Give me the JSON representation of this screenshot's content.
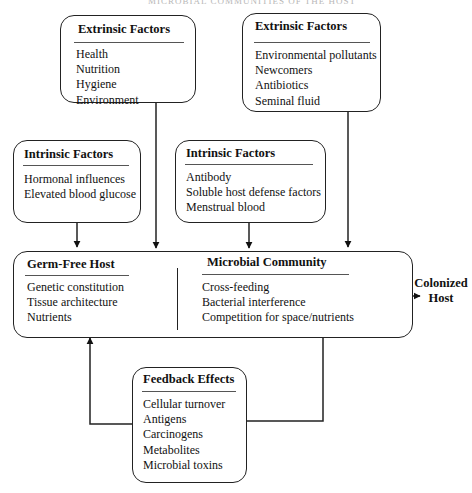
{
  "page_header": "MICROBIAL COMMUNITIES OF THE HOST",
  "extrinsic_left": {
    "title": "Extrinsic Factors",
    "items": [
      "Health",
      "Nutrition",
      "Hygiene",
      "Environment"
    ]
  },
  "extrinsic_right": {
    "title": "Extrinsic Factors",
    "items": [
      "Environmental pollutants",
      "Newcomers",
      "Antibiotics",
      "Seminal fluid"
    ]
  },
  "intrinsic_left": {
    "title": "Intrinsic Factors",
    "items": [
      "Hormonal influences",
      "Elevated blood glucose"
    ]
  },
  "intrinsic_right": {
    "title": "Intrinsic Factors",
    "items": [
      "Antibody",
      "Soluble host defense factors",
      "Menstrual blood"
    ]
  },
  "germ_free_host": {
    "title": "Germ-Free Host",
    "items": [
      "Genetic constitution",
      "Tissue architecture",
      "Nutrients"
    ]
  },
  "microbial_community": {
    "title": "Microbial  Community",
    "items": [
      "Cross-feeding",
      "Bacterial interference",
      "Competition for space/nutrients"
    ]
  },
  "outcome": {
    "line1": "Colonized",
    "line2": "Host"
  },
  "feedback_effects": {
    "title": "Feedback Effects",
    "items": [
      "Cellular turnover",
      "Antigens",
      "Carcinogens",
      "Metabolites",
      "Microbial toxins"
    ]
  },
  "colors": {
    "stroke": "#222222",
    "background": "#ffffff"
  }
}
